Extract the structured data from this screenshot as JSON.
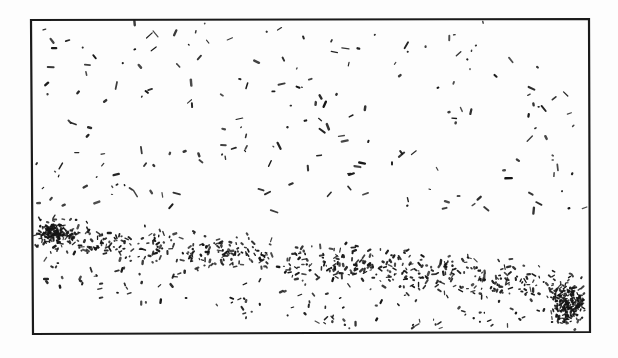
{
  "figure": {
    "title": "",
    "caption": "",
    "type": "scanned-micrograph-schematic",
    "background_color": "#fdfdfd",
    "ink_color": "#141414",
    "border": {
      "name": "figure-frame",
      "color": "#1a1a1a",
      "left": 31,
      "top": 20,
      "right": 589,
      "bottom": 334,
      "stroke_width": 2.2
    },
    "regions": [
      {
        "name": "sparse-upper-field",
        "label": "Sparse scatter region",
        "y_from": 22,
        "y_to": 215,
        "density": "low",
        "particle_count": 196
      },
      {
        "name": "dense-band",
        "label": "Dense particle band",
        "y_from": 215,
        "y_to": 332,
        "density": "high",
        "particle_count": 620
      },
      {
        "name": "left-edge-cluster",
        "label": "Left edge dense cluster",
        "x_center": 55,
        "y_center": 232,
        "density": "very-high",
        "particle_count": 130
      },
      {
        "name": "bottom-right-cluster",
        "label": "Bottom-right corner dense cluster",
        "x_center": 568,
        "y_center": 305,
        "density": "very-high",
        "particle_count": 170
      }
    ],
    "band_profile": {
      "note": "Approximate vertical centre of the dense band sampled left-to-right",
      "x": [
        31,
        90,
        150,
        210,
        270,
        330,
        390,
        450,
        510,
        560,
        589
      ],
      "y_center": [
        234,
        242,
        248,
        252,
        258,
        264,
        270,
        276,
        282,
        292,
        300
      ],
      "half_height": [
        22,
        26,
        28,
        30,
        30,
        30,
        30,
        30,
        30,
        32,
        34
      ]
    },
    "particle": {
      "shape": "elongated-dash",
      "min_length_px": 2,
      "max_length_px": 9,
      "thickness_px": 1.6,
      "orientation": "random"
    },
    "random_seed": 20240607
  }
}
